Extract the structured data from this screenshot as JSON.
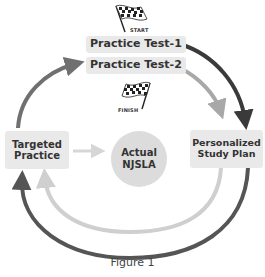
{
  "diagram": {
    "start_label": "START",
    "finish_label": "FINISH",
    "nodes": {
      "practice_test_1": "Practice Test-1",
      "practice_test_2": "Practice Test-2",
      "targeted_practice_line1": "Targeted",
      "targeted_practice_line2": "Practice",
      "actual_line1": "Actual",
      "actual_line2": "NJSLA",
      "study_plan_line1": "Personalized",
      "study_plan_line2": "Study Plan"
    },
    "edges": [
      {
        "from": "Practice Test-1",
        "to": "Personalized Study Plan",
        "color": "#3a3a3a"
      },
      {
        "from": "Personalized Study Plan",
        "to": "Targeted Practice",
        "color": "#555555"
      },
      {
        "from": "Targeted Practice",
        "to": "Practice Test-2",
        "color": "#6e6e6e"
      },
      {
        "from": "Practice Test-2",
        "to": "Personalized Study Plan",
        "color": "#a8a8a8"
      },
      {
        "from": "Personalized Study Plan",
        "to": "Targeted Practice",
        "color": "#cfcfcf"
      },
      {
        "from": "Targeted Practice",
        "to": "Actual NJSLA",
        "color": "#d6d6d6"
      }
    ],
    "caption": "Figure 1"
  }
}
